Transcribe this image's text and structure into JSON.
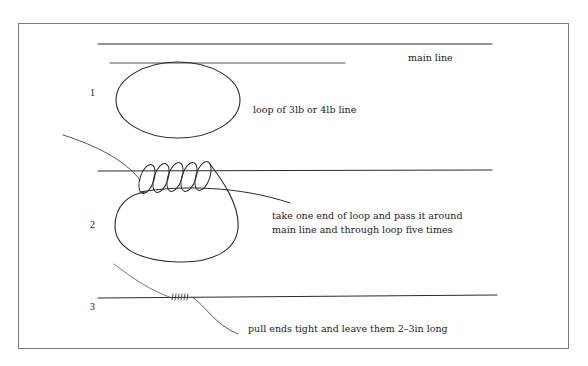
{
  "figure": {
    "labels": {
      "main_line": "main line",
      "loop": "loop of 3lb or 4lb line",
      "step2_line1": "take one end of loop and pass it around",
      "step2_line2": "main line and through loop five times",
      "step3": "pull ends tight and leave them 2–3in long"
    },
    "steps": [
      "1",
      "2",
      "3"
    ],
    "colors": {
      "line": "#2a2a2a",
      "frame": "#7a7a7a",
      "background": "#ffffff"
    },
    "coil_turns": 5
  }
}
